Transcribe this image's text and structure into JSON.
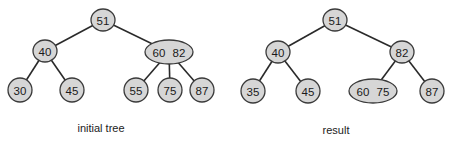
{
  "diagrams": [
    {
      "caption": "initial tree",
      "caption_pos": [
        101,
        122
      ],
      "nodes": [
        {
          "id": "a",
          "keys": [
            "51"
          ],
          "x": 103,
          "y": 20,
          "rx": 12,
          "ry": 11
        },
        {
          "id": "b",
          "keys": [
            "40"
          ],
          "x": 45,
          "y": 51,
          "rx": 12,
          "ry": 11
        },
        {
          "id": "c",
          "keys": [
            "60",
            "82"
          ],
          "x": 169,
          "y": 52,
          "rx": 24,
          "ry": 12
        },
        {
          "id": "d",
          "keys": [
            "30"
          ],
          "x": 20,
          "y": 90,
          "rx": 12,
          "ry": 12
        },
        {
          "id": "e",
          "keys": [
            "45"
          ],
          "x": 72,
          "y": 90,
          "rx": 12,
          "ry": 12
        },
        {
          "id": "f",
          "keys": [
            "55"
          ],
          "x": 136,
          "y": 90,
          "rx": 12,
          "ry": 12
        },
        {
          "id": "g",
          "keys": [
            "75"
          ],
          "x": 170,
          "y": 90,
          "rx": 12,
          "ry": 12
        },
        {
          "id": "h",
          "keys": [
            "87"
          ],
          "x": 202,
          "y": 90,
          "rx": 12,
          "ry": 12
        }
      ],
      "edges": [
        [
          "a",
          "b"
        ],
        [
          "a",
          "c"
        ],
        [
          "b",
          "d"
        ],
        [
          "b",
          "e"
        ],
        [
          "c",
          "f"
        ],
        [
          "c",
          "g"
        ],
        [
          "c",
          "h"
        ]
      ]
    },
    {
      "caption": "result",
      "caption_pos": [
        336,
        124
      ],
      "nodes": [
        {
          "id": "a",
          "keys": [
            "51"
          ],
          "x": 335,
          "y": 20,
          "rx": 12,
          "ry": 11
        },
        {
          "id": "b",
          "keys": [
            "40"
          ],
          "x": 278,
          "y": 52,
          "rx": 12,
          "ry": 11
        },
        {
          "id": "c",
          "keys": [
            "82"
          ],
          "x": 402,
          "y": 52,
          "rx": 12,
          "ry": 11
        },
        {
          "id": "d",
          "keys": [
            "35"
          ],
          "x": 253,
          "y": 91,
          "rx": 12,
          "ry": 12
        },
        {
          "id": "e",
          "keys": [
            "45"
          ],
          "x": 308,
          "y": 91,
          "rx": 12,
          "ry": 12
        },
        {
          "id": "f",
          "keys": [
            "60",
            "75"
          ],
          "x": 373,
          "y": 91,
          "rx": 24,
          "ry": 12
        },
        {
          "id": "g",
          "keys": [
            "87"
          ],
          "x": 432,
          "y": 91,
          "rx": 12,
          "ry": 12
        }
      ],
      "edges": [
        [
          "a",
          "b"
        ],
        [
          "a",
          "c"
        ],
        [
          "b",
          "d"
        ],
        [
          "b",
          "e"
        ],
        [
          "c",
          "f"
        ],
        [
          "c",
          "g"
        ]
      ]
    }
  ],
  "colors": {
    "node_fill": "#d6d6d6",
    "node_stroke": "#3a3a3a",
    "edge": "#2a2a2a",
    "text": "#1a1a1a"
  }
}
